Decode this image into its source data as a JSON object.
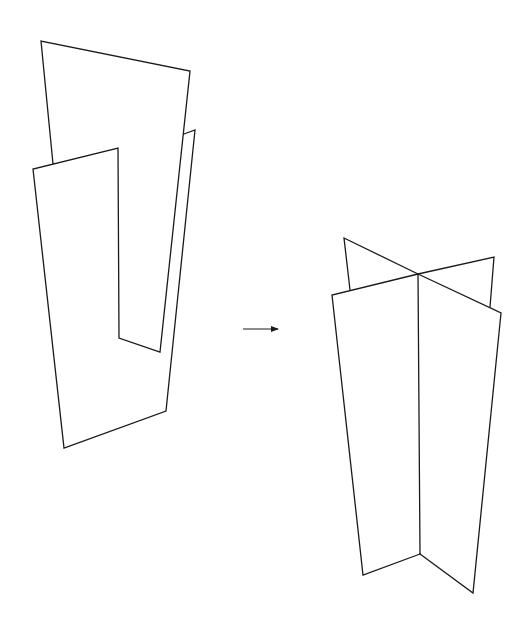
{
  "diagram": {
    "stroke_color": "#1a1a1a",
    "background": "#ffffff",
    "left_figure": {
      "label": "",
      "polylines": [
        [
          [
            53,
            164
          ],
          [
            41,
            41
          ],
          [
            190,
            71
          ],
          [
            160,
            352
          ],
          [
            119,
            338
          ],
          [
            118,
            148
          ],
          [
            33,
            169
          ],
          [
            64,
            448
          ],
          [
            166,
            411
          ],
          [
            195,
            130
          ],
          [
            184,
            134
          ]
        ]
      ]
    },
    "arrow": {
      "from": [
        243,
        329
      ],
      "to": [
        278,
        329
      ]
    },
    "right_figure": {
      "label": "",
      "polylines": [
        [
          [
            350,
            290
          ],
          [
            344,
            238
          ],
          [
            418,
            274
          ]
        ],
        [
          [
            490,
            307
          ],
          [
            494,
            257
          ],
          [
            418,
            274
          ]
        ],
        [
          [
            418,
            274
          ],
          [
            332,
            295
          ],
          [
            363,
            575
          ],
          [
            420,
            554
          ]
        ],
        [
          [
            418,
            274
          ],
          [
            501,
            313
          ],
          [
            473,
            593
          ],
          [
            420,
            554
          ]
        ],
        [
          [
            418,
            274
          ],
          [
            420,
            554
          ]
        ]
      ]
    }
  }
}
